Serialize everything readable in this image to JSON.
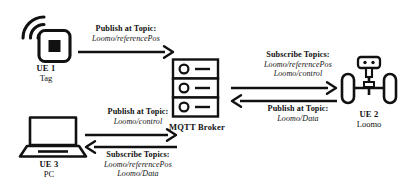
{
  "diagram": {
    "stroke_color": "#111111",
    "background_color": "#ffffff"
  },
  "nodes": [
    {
      "id": "ue1",
      "icon": "wireless-tag-icon",
      "name": "UE 1",
      "role": "Tag"
    },
    {
      "id": "broker",
      "icon": "server-rack-icon",
      "name": "MQTT Broker",
      "role": ""
    },
    {
      "id": "ue2",
      "icon": "segway-robot-icon",
      "name": "UE 2",
      "role": "Loomo"
    },
    {
      "id": "ue3",
      "icon": "laptop-icon",
      "name": "UE 3",
      "role": "PC"
    }
  ],
  "flows": [
    {
      "id": "ue1-to-broker",
      "from": "ue1",
      "to": "broker",
      "direction": "right",
      "title": "Publish at Topic:",
      "topics": [
        "Loomo/referencePos"
      ]
    },
    {
      "id": "broker-to-ue2",
      "from": "broker",
      "to": "ue2",
      "direction": "right",
      "title": "Subscribe Topics:",
      "topics": [
        "Loomo/referencePos",
        "Loomo/control"
      ]
    },
    {
      "id": "ue2-to-broker",
      "from": "ue2",
      "to": "broker",
      "direction": "left",
      "title": "Publish at Topic:",
      "topics": [
        "Loomo/Data"
      ]
    },
    {
      "id": "ue3-to-broker",
      "from": "ue3",
      "to": "broker",
      "direction": "right",
      "title": "Publish at Topic:",
      "topics": [
        "Loomo/control"
      ]
    },
    {
      "id": "broker-to-ue3",
      "from": "broker",
      "to": "ue3",
      "direction": "left",
      "title": "Subscribe Topics:",
      "topics": [
        "Loomo/referencePos",
        "Loomo/Data"
      ]
    }
  ]
}
